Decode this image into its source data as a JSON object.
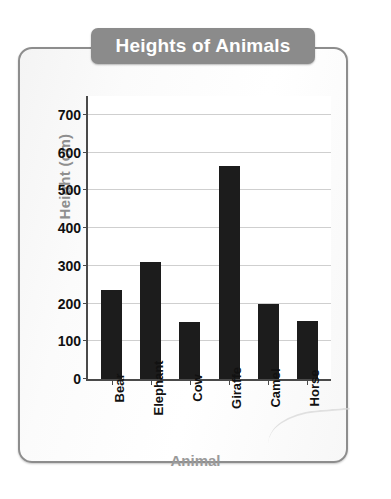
{
  "chart_data": {
    "type": "bar",
    "title": "Heights of Animals",
    "xlabel": "Animal",
    "ylabel": "Height (cm)",
    "categories": [
      "Bear",
      "Elephant",
      "Cow",
      "Giraffe",
      "Camel",
      "Horse"
    ],
    "values": [
      235,
      310,
      150,
      565,
      200,
      155
    ],
    "ylim": [
      0,
      750
    ],
    "yticks": [
      0,
      100,
      200,
      300,
      400,
      500,
      600,
      700
    ],
    "ytick_labels": [
      "0",
      "100",
      "200",
      "300",
      "400",
      "500",
      "600",
      "700"
    ],
    "grid": true,
    "legend": null,
    "bar_color": "#1c1c1c",
    "title_banner_color": "#8b8b8b",
    "axis_label_color": "#8f8f8f"
  }
}
